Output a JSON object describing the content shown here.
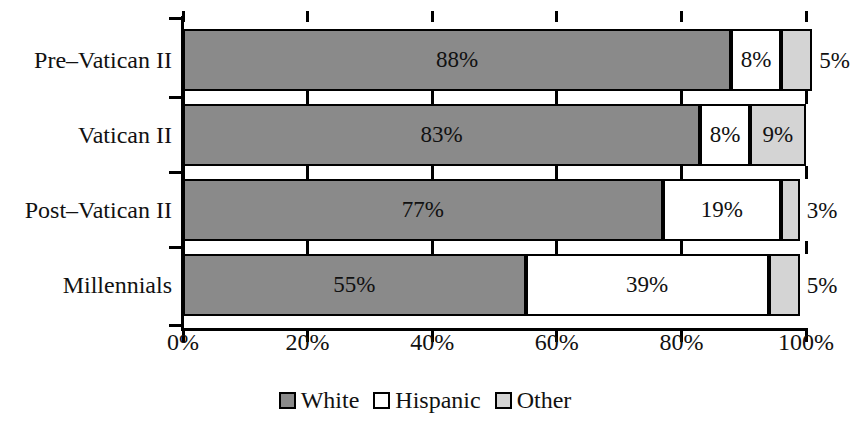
{
  "chart_data": {
    "type": "bar",
    "orientation": "horizontal",
    "stacked": true,
    "title": "",
    "subtitle": "",
    "xlabel": "",
    "ylabel": "",
    "xlim": [
      0,
      100
    ],
    "grid": false,
    "legend_position": "bottom-center",
    "categories": [
      "Pre–Vatican II",
      "Vatican II",
      "Post–Vatican II",
      "Millennials"
    ],
    "series": [
      {
        "name": "White",
        "color": "#8a8a8a",
        "values": [
          88,
          83,
          77,
          55
        ]
      },
      {
        "name": "Hispanic",
        "color": "#ffffff",
        "values": [
          8,
          8,
          19,
          39
        ]
      },
      {
        "name": "Other",
        "color": "#d4d4d4",
        "values": [
          5,
          9,
          3,
          5
        ]
      }
    ],
    "xticks": [
      0,
      20,
      40,
      60,
      80,
      100
    ],
    "xtick_labels": [
      "0%",
      "20%",
      "40%",
      "60%",
      "80%",
      "100%"
    ],
    "data_labels": [
      [
        {
          "text": "88%",
          "placement": "inside"
        },
        {
          "text": "8%",
          "placement": "inside"
        },
        {
          "text": "5%",
          "placement": "outside"
        }
      ],
      [
        {
          "text": "83%",
          "placement": "inside"
        },
        {
          "text": "8%",
          "placement": "inside"
        },
        {
          "text": "9%",
          "placement": "inside"
        }
      ],
      [
        {
          "text": "77%",
          "placement": "inside"
        },
        {
          "text": "19%",
          "placement": "inside"
        },
        {
          "text": "3%",
          "placement": "outside"
        }
      ],
      [
        {
          "text": "55%",
          "placement": "inside"
        },
        {
          "text": "39%",
          "placement": "inside"
        },
        {
          "text": "5%",
          "placement": "outside"
        }
      ]
    ]
  },
  "legend": {
    "items": [
      {
        "label": "White",
        "swatch": "#8a8a8a"
      },
      {
        "label": "Hispanic",
        "swatch": "#ffffff"
      },
      {
        "label": "Other",
        "swatch": "#d4d4d4"
      }
    ]
  }
}
